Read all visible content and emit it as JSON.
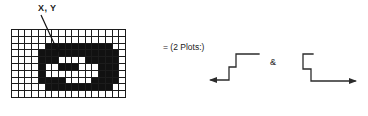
{
  "figure": {
    "annotation_label": "X, Y",
    "equation_text": "= (2 Plots:)",
    "conjunction": "&",
    "ink_color": "#111111",
    "grid_line_color": "#1c1c1c",
    "background_color": "#ffffff"
  },
  "grid": {
    "columns": 17,
    "rows": 10,
    "pointed_cell": {
      "col": 5,
      "row": 2
    },
    "cells": [
      [
        0,
        0,
        0,
        0,
        0,
        0,
        0,
        0,
        0,
        0,
        0,
        0,
        0,
        0,
        0,
        0,
        0
      ],
      [
        0,
        0,
        0,
        0,
        0,
        0,
        0,
        0,
        0,
        0,
        0,
        0,
        0,
        0,
        0,
        0,
        0
      ],
      [
        0,
        0,
        0,
        0,
        0,
        1,
        1,
        1,
        1,
        1,
        1,
        1,
        1,
        1,
        1,
        0,
        0
      ],
      [
        0,
        0,
        0,
        0,
        1,
        1,
        1,
        1,
        1,
        1,
        1,
        1,
        1,
        1,
        1,
        1,
        0
      ],
      [
        0,
        0,
        0,
        0,
        1,
        1,
        1,
        0,
        0,
        0,
        0,
        1,
        1,
        1,
        1,
        1,
        0
      ],
      [
        0,
        0,
        0,
        0,
        1,
        0,
        0,
        1,
        1,
        1,
        0,
        0,
        0,
        1,
        1,
        1,
        0
      ],
      [
        0,
        0,
        0,
        0,
        1,
        0,
        0,
        0,
        0,
        0,
        0,
        0,
        0,
        1,
        1,
        1,
        0
      ],
      [
        0,
        0,
        0,
        0,
        1,
        1,
        1,
        1,
        0,
        0,
        0,
        0,
        1,
        1,
        1,
        1,
        0
      ],
      [
        0,
        0,
        0,
        0,
        0,
        1,
        1,
        1,
        1,
        1,
        1,
        1,
        1,
        1,
        1,
        0,
        0
      ],
      [
        0,
        0,
        0,
        0,
        0,
        0,
        0,
        0,
        0,
        0,
        0,
        0,
        0,
        0,
        0,
        0,
        0
      ]
    ]
  },
  "arrows": {
    "left": {
      "name": "step-down-left-arrow",
      "direction": "left"
    },
    "right": {
      "name": "step-down-right-arrow",
      "direction": "right"
    }
  }
}
